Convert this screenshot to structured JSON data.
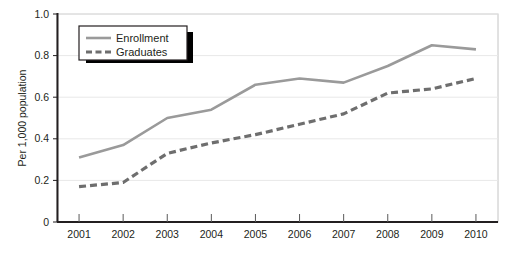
{
  "chart_data": {
    "type": "line",
    "title": "",
    "xlabel": "",
    "ylabel": "Per 1,000 population",
    "categories": [
      "2001",
      "2002",
      "2003",
      "2004",
      "2005",
      "2006",
      "2007",
      "2008",
      "2009",
      "2010"
    ],
    "x": [
      2001,
      2002,
      2003,
      2004,
      2005,
      2006,
      2007,
      2008,
      2009,
      2010
    ],
    "series": [
      {
        "name": "Enrollment",
        "values": [
          0.31,
          0.37,
          0.5,
          0.54,
          0.66,
          0.69,
          0.67,
          0.75,
          0.85,
          0.83
        ],
        "color": "#9a9a9a",
        "style": "solid"
      },
      {
        "name": "Graduates",
        "values": [
          0.17,
          0.19,
          0.33,
          0.38,
          0.42,
          0.47,
          0.52,
          0.62,
          0.64,
          0.69
        ],
        "color": "#6e6e6e",
        "style": "dashed"
      }
    ],
    "ylim": [
      0,
      1.0
    ],
    "yticks": [
      0,
      0.2,
      0.4,
      0.6,
      0.8,
      1.0
    ],
    "ytick_labels": [
      "0",
      "0.2",
      "0.4",
      "0.6",
      "0.8",
      "1.0"
    ],
    "grid": true,
    "grid_color": "#e8e8e8",
    "legend_position": "top-left",
    "axis_color": "#231f20",
    "plot_border_color": "#bdbdbd",
    "background": "#ffffff"
  },
  "legend": {
    "items": [
      {
        "label": "Enrollment"
      },
      {
        "label": "Graduates"
      }
    ]
  },
  "yaxis": {
    "title": "Per 1,000 population",
    "labels": [
      "1.0",
      "0.8",
      "0.6",
      "0.4",
      "0.2",
      "0"
    ]
  },
  "xaxis": {
    "labels": [
      "2001",
      "2002",
      "2003",
      "2004",
      "2005",
      "2006",
      "2007",
      "2008",
      "2009",
      "2010"
    ]
  }
}
